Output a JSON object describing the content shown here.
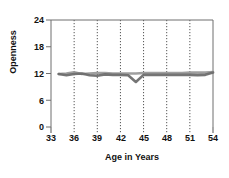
{
  "chart_data": {
    "type": "line",
    "title": "",
    "xlabel": "Age in Years",
    "ylabel": "Openness",
    "xlim": [
      33,
      54
    ],
    "ylim": [
      0,
      24
    ],
    "xticks": [
      33,
      36,
      39,
      42,
      45,
      48,
      51,
      54
    ],
    "yticks": [
      0,
      6,
      12,
      18,
      24
    ],
    "grid": "vertical-dotted",
    "legend": "none",
    "x": [
      34,
      35,
      36,
      37,
      38,
      39,
      40,
      41,
      42,
      43,
      44,
      45,
      46,
      47,
      48,
      49,
      50,
      51,
      52,
      53,
      54
    ],
    "series": [
      {
        "name": "upper",
        "color": "#9a9a9a",
        "values": [
          11.9,
          12.0,
          12.3,
          11.9,
          12.0,
          12.1,
          12.1,
          12.0,
          12.0,
          12.0,
          12.0,
          12.1,
          12.1,
          12.1,
          12.1,
          12.1,
          12.1,
          12.2,
          12.2,
          12.2,
          12.3
        ]
      },
      {
        "name": "lower",
        "color": "#6e6e6e",
        "values": [
          11.9,
          11.6,
          11.9,
          12.0,
          11.6,
          11.5,
          11.8,
          11.7,
          11.7,
          11.6,
          10.1,
          11.7,
          11.7,
          11.7,
          11.7,
          11.7,
          11.7,
          11.7,
          11.6,
          11.7,
          12.2
        ]
      }
    ]
  },
  "axis": {
    "y_tick_labels": [
      "24",
      "18",
      "12",
      "6",
      "0"
    ],
    "x_tick_labels": [
      "33",
      "36",
      "39",
      "42",
      "45",
      "48",
      "51",
      "54"
    ],
    "y_title": "Openness",
    "x_title": "Age in Years"
  },
  "colors": {
    "axis": "#6f6f6f",
    "gridline": "#555555",
    "text": "#111111",
    "series_upper": "#9a9a9a",
    "series_lower": "#6e6e6e",
    "background": "#ffffff"
  }
}
